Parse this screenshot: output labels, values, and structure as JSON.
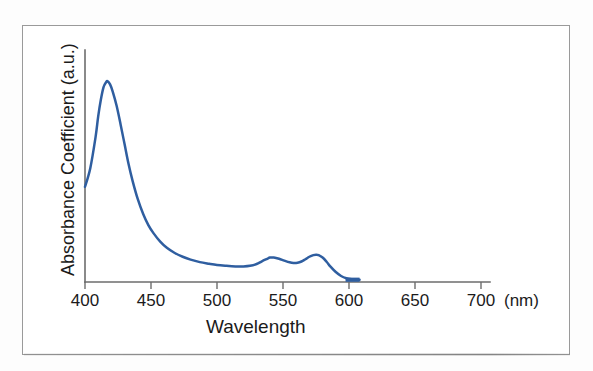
{
  "figure": {
    "frame_visible": true,
    "background_color": "#ffffff",
    "border_color": "#9a9a9a"
  },
  "axes": {
    "x_axis_color": "#6d6d6d",
    "y_axis_color": "#6d6d6d"
  },
  "chart_data": {
    "type": "line",
    "title": "",
    "subtitle": "",
    "xlabel": "Wavelength",
    "ylabel": "Absorbance Coefficient (a.u.)",
    "x_unit": "(nm)",
    "grid": false,
    "legend": null,
    "legend_position": "none",
    "xlim": [
      400,
      700
    ],
    "ylim": [
      0,
      1.0
    ],
    "xticks": [
      400,
      450,
      500,
      550,
      600,
      650,
      700
    ],
    "xtick_labels": [
      "400",
      "450",
      "500",
      "550",
      "600",
      "650",
      "700"
    ],
    "yticks": [],
    "ytick_labels": [],
    "series": [
      {
        "name": "Absorbance spectrum",
        "color": "#2f5ea0",
        "line_width": 2.5,
        "x": [
          400,
          404,
          408,
          410,
          412,
          414,
          416,
          417,
          419,
          421,
          424,
          427,
          430,
          433,
          436,
          440,
          444,
          448,
          452,
          457,
          462,
          468,
          474,
          480,
          487,
          494,
          500,
          507,
          514,
          520,
          525,
          530,
          534,
          538,
          540,
          543,
          547,
          551,
          555,
          558,
          561,
          564,
          567,
          570,
          573,
          575,
          577,
          580,
          583,
          586,
          590,
          594,
          598,
          602,
          606,
          608
        ],
        "y": [
          0.46,
          0.55,
          0.7,
          0.8,
          0.88,
          0.94,
          0.965,
          0.97,
          0.955,
          0.92,
          0.85,
          0.76,
          0.665,
          0.57,
          0.49,
          0.4,
          0.33,
          0.275,
          0.235,
          0.195,
          0.165,
          0.14,
          0.122,
          0.108,
          0.096,
          0.088,
          0.082,
          0.078,
          0.075,
          0.075,
          0.078,
          0.087,
          0.1,
          0.112,
          0.118,
          0.118,
          0.112,
          0.103,
          0.095,
          0.092,
          0.093,
          0.099,
          0.11,
          0.122,
          0.13,
          0.132,
          0.13,
          0.118,
          0.098,
          0.074,
          0.048,
          0.029,
          0.018,
          0.013,
          0.011,
          0.011
        ]
      }
    ],
    "annotations": [
      {
        "name": "soret-band-peak",
        "x": 417,
        "y": 0.97,
        "label": ""
      },
      {
        "name": "q-band-peak-1",
        "x": 540,
        "y": 0.118,
        "label": ""
      },
      {
        "name": "q-band-peak-2",
        "x": 575,
        "y": 0.132,
        "label": ""
      }
    ]
  }
}
